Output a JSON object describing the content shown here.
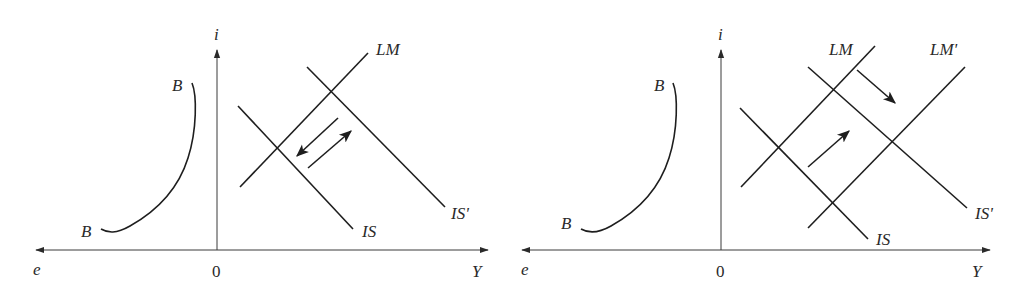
{
  "colors": {
    "ink": "#1e1e1e",
    "axis": "#3a3a3a",
    "background": "#ffffff"
  },
  "panels": [
    {
      "id": "left",
      "axes": {
        "vertical": "i",
        "horizontal_right": "Y",
        "horizontal_left": "e",
        "origin": "0"
      },
      "curves": {
        "bb": {
          "label_top": "B",
          "label_bottom": "B"
        },
        "lm": {
          "label": "LM"
        },
        "is": {
          "label": "IS"
        },
        "is_prime": {
          "label": "IS'"
        }
      },
      "arrows": [
        "down-left (IS shift back)",
        "up-right (IS shift out)"
      ]
    },
    {
      "id": "right",
      "axes": {
        "vertical": "i",
        "horizontal_right": "Y",
        "horizontal_left": "e",
        "origin": "0"
      },
      "curves": {
        "bb": {
          "label_top": "B",
          "label_bottom": "B"
        },
        "lm": {
          "label": "LM"
        },
        "lm_prime": {
          "label": "LM'"
        },
        "is": {
          "label": "IS"
        },
        "is_prime": {
          "label": "IS'"
        }
      },
      "arrows": [
        "down-right (LM shift to LM')",
        "up-right (IS shift to IS')"
      ]
    }
  ]
}
